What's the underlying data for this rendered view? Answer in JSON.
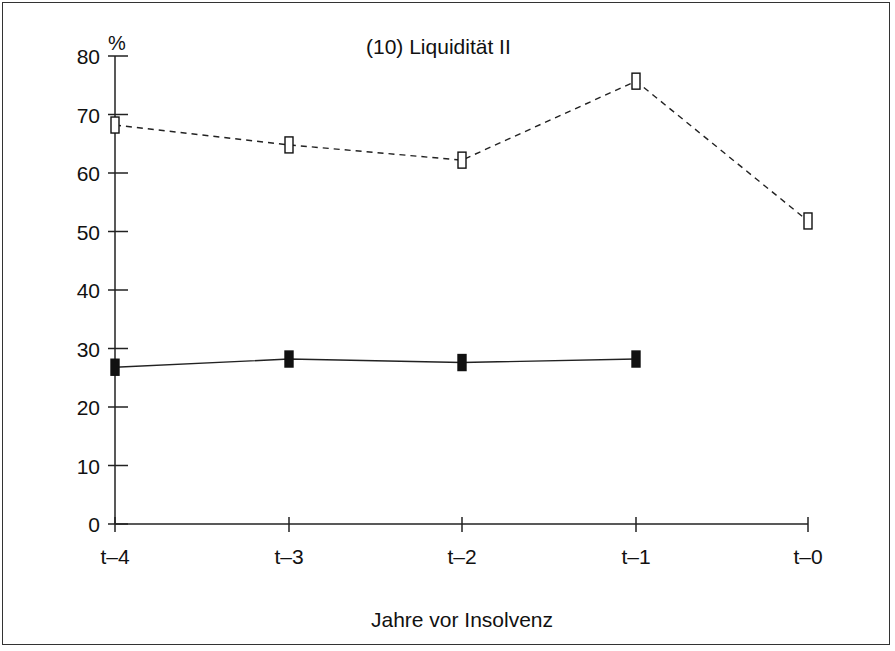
{
  "chart_data": {
    "type": "line",
    "title": "(10) Liquidität II",
    "xlabel": "Jahre vor Insolvenz",
    "ylabel": "%",
    "categories": [
      "t–4",
      "t–3",
      "t–2",
      "t–1",
      "t–0"
    ],
    "ylim": [
      0,
      80
    ],
    "yticks": [
      0,
      10,
      20,
      30,
      40,
      50,
      60,
      70,
      80
    ],
    "grid": false,
    "legend": null,
    "series": [
      {
        "name": "open markers (dashed)",
        "style": "dashed",
        "marker": "open-rect",
        "values": [
          68.2,
          64.8,
          62.2,
          75.7,
          51.8
        ]
      },
      {
        "name": "filled markers (solid)",
        "style": "solid",
        "marker": "filled-rect",
        "values": [
          26.8,
          28.2,
          27.6,
          28.2,
          null
        ]
      }
    ]
  },
  "labels": {
    "title": "(10) Liquidität II",
    "unit": "%",
    "xlabel": "Jahre vor Insolvenz",
    "yticks": [
      "0",
      "10",
      "20",
      "30",
      "40",
      "50",
      "60",
      "70",
      "80"
    ],
    "xticks": [
      "t–4",
      "t–3",
      "t–2",
      "t–1",
      "t–0"
    ]
  }
}
